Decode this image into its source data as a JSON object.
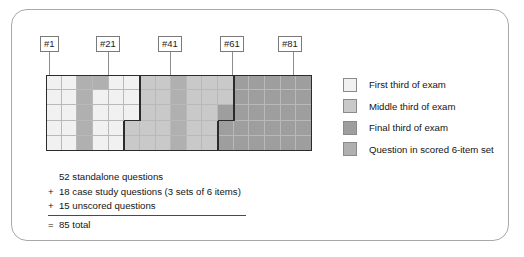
{
  "figure": {
    "callouts": [
      {
        "label": "#1",
        "box_left": 28,
        "box_top": 26,
        "leader_x": 37,
        "leader_top": 42,
        "leader_height": 23
      },
      {
        "label": "#21",
        "box_left": 84,
        "box_top": 26,
        "leader_x": 96,
        "leader_top": 42,
        "leader_height": 23
      },
      {
        "label": "#41",
        "box_left": 146,
        "box_top": 26,
        "leader_x": 158,
        "leader_top": 42,
        "leader_height": 23
      },
      {
        "label": "#61",
        "box_left": 208,
        "box_top": 26,
        "leader_x": 220,
        "leader_top": 42,
        "leader_height": 23
      },
      {
        "label": "#81",
        "box_left": 266,
        "box_top": 26,
        "leader_x": 281,
        "leader_top": 42,
        "leader_height": 23
      }
    ],
    "legend": [
      {
        "label": "First third of exam",
        "color": "#f1f1f1"
      },
      {
        "label": "Middle third of exam",
        "color": "#c9c9c9"
      },
      {
        "label": "Final third of exam",
        "color": "#9e9e9e"
      },
      {
        "label": "Question in scored 6-item set",
        "color": "#b0b0b0"
      }
    ],
    "summary": [
      {
        "op": "",
        "text": "52 standalone questions"
      },
      {
        "op": "+",
        "text": "18 case study questions (3 sets of 6 items)"
      },
      {
        "op": "+",
        "text": "15 unscored questions"
      },
      {
        "op": "=",
        "text": "85 total",
        "after_rule": true
      }
    ]
  },
  "chart_data": {
    "type": "heatmap",
    "xlabel": "Question number",
    "ylabel": "",
    "columns": 17,
    "rows": 5,
    "total_cells": 85,
    "order": "column-major",
    "tick_labels": [
      "#1",
      "#21",
      "#41",
      "#61",
      "#81"
    ],
    "legend_position": "right",
    "grid": true,
    "palette": {
      "first_third": "#f1f1f1",
      "middle_third": "#c9c9c9",
      "final_third": "#9e9e9e",
      "scored_six_item_set": "#b0b0b0"
    },
    "column_categories": [
      "first_third",
      "first_third",
      "scored_six_item_set",
      "scored_six_item_set",
      "first_third",
      "first_third",
      "middle_third",
      "middle_third",
      "scored_six_item_set",
      "middle_third",
      "middle_third",
      "middle_third",
      "final_third",
      "final_third",
      "final_third",
      "final_third",
      "final_third"
    ],
    "cells": [
      [
        "first_third",
        "first_third",
        "scored_six_item_set",
        "scored_six_item_set",
        "first_third",
        "first_third",
        "middle_third",
        "middle_third",
        "scored_six_item_set",
        "middle_third",
        "middle_third",
        "middle_third",
        "final_third",
        "final_third",
        "final_third",
        "final_third",
        "final_third"
      ],
      [
        "first_third",
        "first_third",
        "scored_six_item_set",
        "first_third",
        "first_third",
        "first_third",
        "middle_third",
        "middle_third",
        "scored_six_item_set",
        "middle_third",
        "middle_third",
        "middle_third",
        "final_third",
        "final_third",
        "final_third",
        "final_third",
        "final_third"
      ],
      [
        "first_third",
        "first_third",
        "scored_six_item_set",
        "first_third",
        "first_third",
        "first_third",
        "middle_third",
        "middle_third",
        "scored_six_item_set",
        "middle_third",
        "middle_third",
        "final_third",
        "final_third",
        "final_third",
        "final_third",
        "final_third",
        "final_third"
      ],
      [
        "first_third",
        "first_third",
        "scored_six_item_set",
        "first_third",
        "first_third",
        "middle_third",
        "middle_third",
        "middle_third",
        "scored_six_item_set",
        "middle_third",
        "middle_third",
        "final_third",
        "final_third",
        "final_third",
        "final_third",
        "final_third",
        "final_third"
      ],
      [
        "first_third",
        "first_third",
        "scored_six_item_set",
        "first_third",
        "first_third",
        "middle_third",
        "middle_third",
        "middle_third",
        "scored_six_item_set",
        "middle_third",
        "middle_third",
        "final_third",
        "final_third",
        "final_third",
        "final_third",
        "final_third",
        "final_third"
      ]
    ],
    "section_boundaries": [
      {
        "name": "first-third/middle-third boundary",
        "after_column_top": 6,
        "after_column_bottom": 5
      },
      {
        "name": "middle-third/final-third boundary",
        "after_column_top": 12,
        "after_column_bottom": 11
      }
    ]
  }
}
